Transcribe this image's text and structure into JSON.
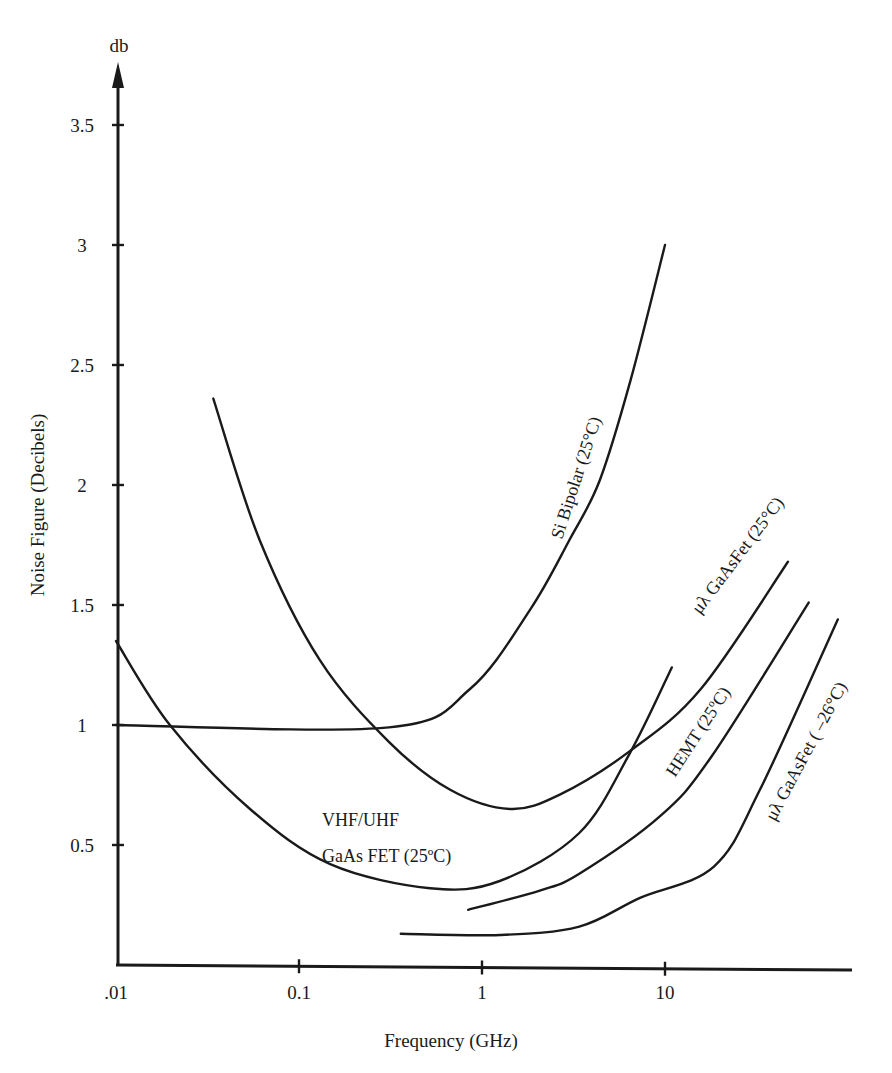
{
  "chart_data": {
    "type": "line",
    "title": "",
    "xlabel": "Frequency (GHz)",
    "ylabel": "Noise Figure (Decibels)",
    "y_unit_label": "db",
    "x_scale": "log",
    "xlim": [
      0.01,
      100
    ],
    "ylim": [
      0,
      3.7
    ],
    "grid": false,
    "legend": "inline labels along curves",
    "x_ticks": [
      {
        "value": 0.01,
        "label": ".01"
      },
      {
        "value": 0.1,
        "label": "0.1"
      },
      {
        "value": 1,
        "label": "1"
      },
      {
        "value": 10,
        "label": "10"
      }
    ],
    "y_ticks": [
      {
        "value": 0.5,
        "label": "0.5"
      },
      {
        "value": 1,
        "label": "1"
      },
      {
        "value": 1.5,
        "label": "1.5"
      },
      {
        "value": 2,
        "label": "2"
      },
      {
        "value": 2.5,
        "label": "2.5"
      },
      {
        "value": 3,
        "label": "3"
      },
      {
        "value": 3.5,
        "label": "3.5"
      }
    ],
    "series": [
      {
        "name": "VHF/UHF GaAs FET (25ºC)",
        "x": [
          0.01,
          0.0197,
          0.054,
          0.148,
          0.52,
          1.25,
          3.4,
          6.4,
          10.9
        ],
        "y": [
          1.35,
          1.0,
          0.65,
          0.42,
          0.32,
          0.35,
          0.55,
          0.88,
          1.24
        ]
      },
      {
        "name": "Si Bipolar (25°C)",
        "x": [
          0.01,
          0.31,
          0.86,
          1.83,
          3.0,
          4.4,
          6.5,
          10
        ],
        "y": [
          1.0,
          0.99,
          1.15,
          1.48,
          1.77,
          2.02,
          2.44,
          3.0
        ]
      },
      {
        "name": "μλ GaAsFet (25°C)",
        "x": [
          0.034,
          0.061,
          0.13,
          0.31,
          0.67,
          1.42,
          2.66,
          6.4,
          15.7,
          47
        ],
        "y": [
          2.36,
          1.77,
          1.27,
          0.93,
          0.73,
          0.65,
          0.71,
          0.89,
          1.15,
          1.68
        ]
      },
      {
        "name": "HEMT (25ºC)",
        "x": [
          0.84,
          2.07,
          3.4,
          9.4,
          18,
          61
        ],
        "y": [
          0.23,
          0.31,
          0.38,
          0.62,
          0.87,
          1.51
        ]
      },
      {
        "name": "μλ GaAsFet ( –26°C)",
        "x": [
          0.36,
          1.25,
          3.4,
          7.3,
          18.5,
          33,
          88
        ],
        "y": [
          0.13,
          0.125,
          0.16,
          0.28,
          0.41,
          0.73,
          1.44
        ]
      }
    ]
  },
  "labels": {
    "y_unit": "db",
    "y_axis_title": "Noise Figure (Decibels)",
    "x_axis_title": "Frequency (GHz)",
    "vhf_line1": "VHF/UHF",
    "vhf_line2": "GaAs FET (25ºC)",
    "si_bipolar": "Si Bipolar (25°C)",
    "ul_gaasfet_25": "μλ GaAsFet (25°C)",
    "hemt": "HEMT (25ºC)",
    "ul_gaasfet_m26": "μλ GaAsFet ( –26°C)"
  }
}
